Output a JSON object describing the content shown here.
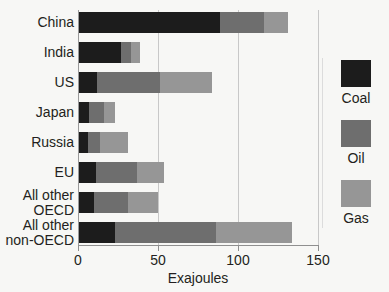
{
  "chart_data": {
    "type": "bar",
    "orientation": "horizontal",
    "stacked": true,
    "title": "",
    "xlabel": "Exajoules",
    "ylabel": "",
    "xlim": [
      0,
      150
    ],
    "xticks": [
      0,
      50,
      100,
      150
    ],
    "xtick_labels": [
      "0",
      "50",
      "100",
      "150"
    ],
    "grid": true,
    "grid_axis": "x",
    "legend_position": "right",
    "categories": [
      "China",
      "India",
      "US",
      "Japan",
      "Russia",
      "EU",
      "All other\nOECD",
      "All other\nnon-OECD"
    ],
    "series": [
      {
        "name": "Coal",
        "color": "#1c1c1c",
        "values": [
          89,
          27,
          12,
          7,
          6,
          11,
          10,
          23
        ]
      },
      {
        "name": "Oil",
        "color": "#6e6e6e",
        "values": [
          27,
          6,
          39,
          9,
          8,
          26,
          21,
          63
        ]
      },
      {
        "name": "Gas",
        "color": "#969696",
        "values": [
          15,
          6,
          33,
          7,
          17,
          17,
          19,
          48
        ]
      }
    ],
    "totals": [
      131,
      39,
      84,
      23,
      31,
      54,
      50,
      134
    ]
  },
  "legend": {
    "items": [
      {
        "label": "Coal",
        "color": "#1c1c1c"
      },
      {
        "label": "Oil",
        "color": "#6e6e6e"
      },
      {
        "label": "Gas",
        "color": "#969696"
      }
    ]
  },
  "colors": {
    "background": "#f7f7f5",
    "text": "#231f20",
    "gridline": "#c8c8c8",
    "axis": "#8f8f8f"
  }
}
